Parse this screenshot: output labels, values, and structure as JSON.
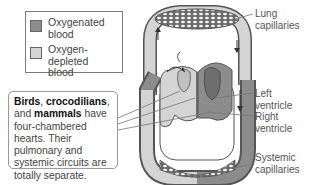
{
  "legend": {
    "items": [
      {
        "label_line1": "Oxygenated",
        "label_line2": "blood",
        "color": "#8c8c8c"
      },
      {
        "label_line1": "Oxygen-depleted",
        "label_line2": "blood",
        "color": "#d4d4d4"
      }
    ]
  },
  "callout": {
    "bold1": "Birds",
    "sep1": ", ",
    "bold2": "crocodilians",
    "sep2": ",",
    "and": "and ",
    "bold3": "mammals",
    "rest": " have four-chambered hearts. Their pulmonary and systemic circuits are totally separate."
  },
  "labels": {
    "lung_line1": "Lung",
    "lung_line2": "capillaries",
    "left_line1": "Left",
    "left_line2": "ventricle",
    "right_line1": "Right",
    "right_line2": "ventricle",
    "systemic_line1": "Systemic",
    "systemic_line2": "capillaries"
  },
  "colors": {
    "oxygenated": "#8c8c8c",
    "depleted": "#d4d4d4",
    "outline": "#555555"
  }
}
